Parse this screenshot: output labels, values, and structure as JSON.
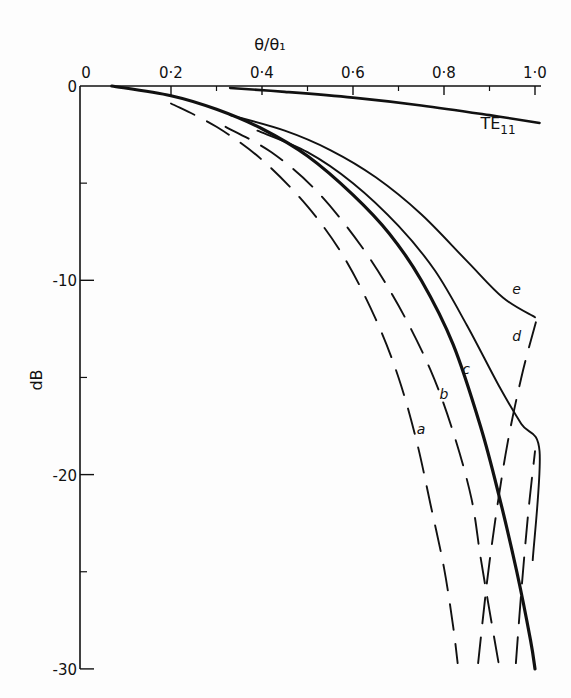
{
  "chart_data": {
    "type": "line",
    "title": "",
    "xlabel": "θ/θ₁",
    "ylabel": "dB",
    "xlim": [
      0,
      1.0
    ],
    "ylim": [
      -30,
      0
    ],
    "x_ticks": [
      {
        "value": 0,
        "label": "0"
      },
      {
        "value": 0.2,
        "label": "0·2"
      },
      {
        "value": 0.4,
        "label": "0·4"
      },
      {
        "value": 0.6,
        "label": "0·6"
      },
      {
        "value": 0.8,
        "label": "0·8"
      },
      {
        "value": 1.0,
        "label": "1·0"
      }
    ],
    "x_minor_ticks": [
      0.3,
      0.5,
      0.7,
      0.9
    ],
    "y_ticks": [
      {
        "value": 0,
        "label": "0"
      },
      {
        "value": -10,
        "label": "-10"
      },
      {
        "value": -20,
        "label": "-20"
      },
      {
        "value": -30,
        "label": "-30"
      }
    ],
    "y_minor_ticks": [
      -5,
      -15,
      -25
    ],
    "x_axis_position": "top",
    "grid": false,
    "series": [
      {
        "name": "TE11",
        "label": "TE11",
        "label_main": "TE",
        "label_sub": "11",
        "style": "solid",
        "weight": "medium",
        "x": [
          0.33,
          0.45,
          0.6,
          0.75,
          0.9,
          1.01
        ],
        "y": [
          -0.1,
          -0.3,
          -0.6,
          -1.0,
          -1.5,
          -1.9
        ],
        "label_at": [
          0.88,
          -2.2
        ]
      },
      {
        "name": "c",
        "label": "c",
        "style": "solid",
        "weight": "heavy",
        "x": [
          0.07,
          0.2,
          0.3,
          0.4,
          0.5,
          0.6,
          0.68,
          0.75,
          0.82,
          0.88,
          0.92,
          0.96,
          0.99,
          1.0
        ],
        "y": [
          0,
          -0.5,
          -1.2,
          -2.2,
          -3.6,
          -5.6,
          -7.6,
          -10.0,
          -13.3,
          -17.5,
          -21.0,
          -25.0,
          -28.5,
          -30
        ],
        "label_at": [
          0.84,
          -14.8
        ]
      },
      {
        "name": "d",
        "label": "d",
        "style": "solid",
        "weight": "normal",
        "x": [
          0.39,
          0.5,
          0.6,
          0.7,
          0.78,
          0.85,
          0.92,
          0.97,
          1.01,
          0.995
        ],
        "y": [
          -2.3,
          -3.4,
          -5.0,
          -7.2,
          -9.5,
          -12.3,
          -15.4,
          -17.4,
          -18.8,
          -24.4
        ],
        "label_at": [
          0.95,
          -13.1
        ]
      },
      {
        "name": "e",
        "label": "e",
        "style": "solid",
        "weight": "normal",
        "x": [
          0.33,
          0.45,
          0.55,
          0.65,
          0.75,
          0.85,
          0.93,
          1.0
        ],
        "y": [
          -1.5,
          -2.3,
          -3.3,
          -4.7,
          -6.6,
          -9.0,
          -10.9,
          -11.9
        ],
        "label_at": [
          0.95,
          -10.7
        ]
      },
      {
        "name": "a",
        "label": "a",
        "style": "dashed",
        "weight": "normal",
        "x": [
          0.2,
          0.3,
          0.4,
          0.5,
          0.58,
          0.65,
          0.7,
          0.74,
          0.77,
          0.8,
          0.82,
          0.83
        ],
        "y": [
          -0.9,
          -2.1,
          -3.8,
          -6.2,
          -8.8,
          -12.0,
          -15.0,
          -18.3,
          -21.5,
          -24.8,
          -27.8,
          -29.7
        ],
        "label_at": [
          0.74,
          -17.9
        ]
      },
      {
        "name": "b",
        "label": "b",
        "style": "dashed",
        "weight": "normal",
        "x": [
          0.32,
          0.42,
          0.52,
          0.62,
          0.7,
          0.77,
          0.82,
          0.86,
          0.88,
          0.9,
          0.92
        ],
        "y": [
          -2.1,
          -3.4,
          -5.4,
          -8.3,
          -11.3,
          -14.6,
          -17.8,
          -21.2,
          -24.2,
          -27.0,
          -29.7
        ],
        "label_at": [
          0.79,
          -16.1
        ]
      },
      {
        "name": "c-dashed-return",
        "label": "",
        "style": "dashed",
        "weight": "normal",
        "x": [
          0.875,
          0.9,
          0.935,
          0.97,
          1.005
        ],
        "y": [
          -29.7,
          -24.5,
          -19.0,
          -15.0,
          -11.9
        ],
        "label_at": null
      },
      {
        "name": "d-dashed-return",
        "label": "",
        "style": "dashed",
        "weight": "normal",
        "x": [
          0.958,
          0.97,
          0.985,
          1.0
        ],
        "y": [
          -29.7,
          -26.0,
          -22.0,
          -18.8
        ],
        "label_at": null
      }
    ]
  }
}
